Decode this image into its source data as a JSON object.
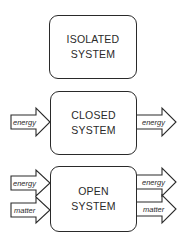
{
  "systems": [
    {
      "id": "isolated",
      "line1": "ISOLATED",
      "line2": "SYSTEM",
      "inputs": [],
      "outputs": []
    },
    {
      "id": "closed",
      "line1": "CLOSED",
      "line2": "SYSTEM",
      "inputs": [
        "energy"
      ],
      "outputs": [
        "energy"
      ]
    },
    {
      "id": "open",
      "line1": "OPEN",
      "line2": "SYSTEM",
      "inputs": [
        "energy",
        "matter"
      ],
      "outputs": [
        "energy",
        "matter"
      ]
    }
  ],
  "labels": {
    "closed_in": "energy",
    "closed_out": "energy",
    "open_in_energy": "energy",
    "open_in_matter": "matter",
    "open_out_energy": "energy",
    "open_out_matter": "matter"
  },
  "colors": {
    "stroke": "#2a2a2a",
    "background": "#ffffff"
  }
}
